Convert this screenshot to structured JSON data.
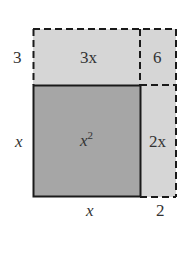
{
  "diagram": {
    "type": "area-model",
    "colors": {
      "square_fill": "#a6a6a6",
      "extension_fill": "#d6d6d6",
      "solid_stroke": "#1a1a1a",
      "dashed_stroke": "#1a1a1a",
      "text": "#333333"
    },
    "regions": [
      {
        "id": "x2",
        "label_base": "x",
        "label_sup": "2"
      },
      {
        "id": "3x",
        "label": "3x"
      },
      {
        "id": "6",
        "label": "6"
      },
      {
        "id": "2x",
        "label": "2x"
      }
    ],
    "side_labels": {
      "left_top": "3",
      "left_bottom": "x",
      "bottom_left": "x",
      "bottom_right": "2"
    }
  }
}
